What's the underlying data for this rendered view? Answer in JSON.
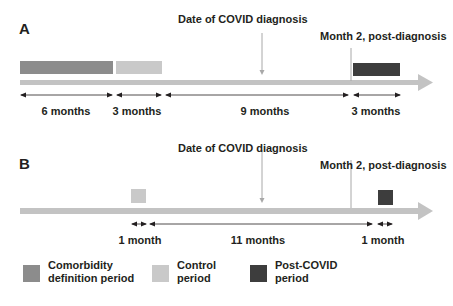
{
  "colors": {
    "comorbidity": "#8c8c8c",
    "control": "#c9c9c9",
    "post_covid": "#3d3d3d",
    "timeline": "#c3c3c3",
    "marker_line": "#a8a8a8",
    "text": "#231f20"
  },
  "panel_a": {
    "label": "A",
    "covid_marker": "Date of COVID diagnosis",
    "month2_marker": "Month 2, post-diagnosis",
    "durations": [
      "6 months",
      "3 months",
      "9 months",
      "3 months"
    ],
    "periods": [
      {
        "name": "Comorbidity definition period",
        "length": "6 months"
      },
      {
        "name": "Control period",
        "length": "3 months"
      },
      {
        "name": "Gap to COVID + 2 months",
        "length": "9 months"
      },
      {
        "name": "Post-COVID period",
        "length": "3 months"
      }
    ]
  },
  "panel_b": {
    "label": "B",
    "covid_marker": "Date of COVID diagnosis",
    "month2_marker": "Month 2, post-diagnosis",
    "durations": [
      "1 month",
      "11 months",
      "1 month"
    ],
    "periods": [
      {
        "name": "Control period",
        "length": "1 month"
      },
      {
        "name": "Gap",
        "length": "11 months"
      },
      {
        "name": "Post-COVID period",
        "length": "1 month"
      }
    ]
  },
  "legend": {
    "items": [
      {
        "line1": "Comorbidity",
        "line2": "definition period",
        "color": "#8c8c8c"
      },
      {
        "line1": "Control",
        "line2": "period",
        "color": "#c9c9c9"
      },
      {
        "line1": "Post-COVID",
        "line2": "period",
        "color": "#3d3d3d"
      }
    ]
  }
}
